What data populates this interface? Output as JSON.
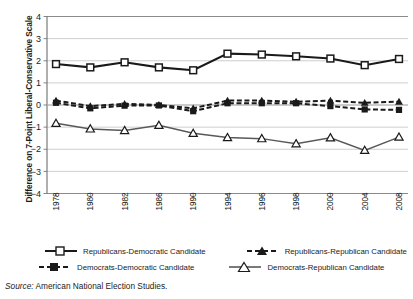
{
  "chart_data": {
    "type": "line",
    "title": "",
    "xlabel": "",
    "ylabel": "Difference on 7-Point Liberal-Conservative Scale",
    "ylim": [
      -4,
      4
    ],
    "yticks": [
      4,
      3,
      2,
      1,
      0,
      -1,
      -2,
      -3,
      -4
    ],
    "ytick_labels": [
      "4",
      "3",
      "2",
      "1",
      "0",
      "−1",
      "−2",
      "−3",
      "−4"
    ],
    "grid": "horizontal",
    "legend_position": "bottom",
    "categories": [
      "1978",
      "1980",
      "1982",
      "1986",
      "1990",
      "1994",
      "1996",
      "1998",
      "2000",
      "2004",
      "2008"
    ],
    "series": [
      {
        "name": "Republicans-Democratic Candidate",
        "marker": "open-square",
        "line": "solid",
        "color": "#1a1a1a",
        "values": [
          1.85,
          1.7,
          1.93,
          1.7,
          1.57,
          2.32,
          2.28,
          2.2,
          2.1,
          1.8,
          2.08
        ]
      },
      {
        "name": "Republicans-Republican Candidate",
        "marker": "filled-triangle",
        "line": "dashed",
        "color": "#1a1a1a",
        "values": [
          0.2,
          -0.05,
          0.05,
          0.0,
          -0.15,
          0.2,
          0.2,
          0.15,
          0.2,
          0.1,
          0.15
        ]
      },
      {
        "name": "Democrats-Democratic Candidate",
        "marker": "filled-square",
        "line": "dashed",
        "color": "#1a1a1a",
        "values": [
          0.1,
          -0.15,
          -0.03,
          -0.02,
          -0.28,
          0.08,
          0.08,
          0.08,
          -0.05,
          -0.2,
          -0.22
        ]
      },
      {
        "name": "Democrats-Republican Candidate",
        "marker": "open-triangle",
        "line": "solid",
        "color": "#595959",
        "values": [
          -0.83,
          -1.08,
          -1.15,
          -0.92,
          -1.28,
          -1.47,
          -1.52,
          -1.75,
          -1.48,
          -2.05,
          -1.45
        ]
      }
    ]
  },
  "legend": {
    "items": [
      {
        "label": "Republicans-Democratic Candidate",
        "marker": "open-square",
        "line": "solid"
      },
      {
        "label": "Republicans-Republican Candidate",
        "marker": "filled-triangle",
        "line": "dashed"
      },
      {
        "label": "Democrats-Democratic Candidate",
        "marker": "filled-square",
        "line": "dashed"
      },
      {
        "label": "Democrats-Republican Candidate",
        "marker": "open-triangle",
        "line": "solid"
      }
    ]
  },
  "source": {
    "prefix": "Source:",
    "text": "American National Election Studies."
  }
}
